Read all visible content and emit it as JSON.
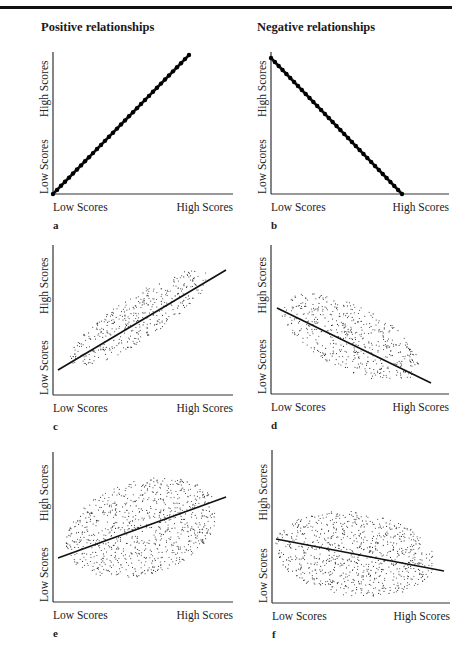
{
  "header": {
    "positive_title": "Positive relationships",
    "negative_title": "Negative relationships"
  },
  "chart_data": [
    {
      "id": "a",
      "type": "line",
      "title": "Positive relationships",
      "letter": "a",
      "xlabel_low": "Low Scores",
      "xlabel_high": "High Scores",
      "ylabel_low": "Low Scores",
      "ylabel_high": "High Scores",
      "relationship": "perfect positive",
      "r": 1.0,
      "line": {
        "x": [
          0,
          0.75
        ],
        "y": [
          0,
          0.98
        ],
        "style": "dotted-heavy"
      },
      "scatter": null,
      "frame": {
        "x0": 53,
        "y0": 194,
        "x1": 233,
        "ytop": 52,
        "lx0": 53,
        "ly0": 194,
        "lx1": 189,
        "ly1": 55
      }
    },
    {
      "id": "b",
      "type": "line",
      "title": "Negative relationships",
      "letter": "b",
      "xlabel_low": "Low Scores",
      "xlabel_high": "High Scores",
      "ylabel_low": "Low Scores",
      "ylabel_high": "High Scores",
      "relationship": "perfect negative",
      "r": -1.0,
      "line": {
        "x": [
          0,
          0.74
        ],
        "y": [
          0.95,
          0
        ],
        "style": "dotted-heavy"
      },
      "scatter": null,
      "frame": {
        "x0": 271,
        "y0": 194,
        "x1": 449,
        "ytop": 52,
        "lx0": 271,
        "ly0": 58,
        "lx1": 402,
        "ly1": 194
      }
    },
    {
      "id": "c",
      "type": "scatter",
      "letter": "c",
      "xlabel_low": "Low Scores",
      "xlabel_high": "High Scores",
      "ylabel_low": "Low Scores",
      "ylabel_high": "High Scores",
      "relationship": "strong positive",
      "line": {
        "style": "solid"
      },
      "scatter": {
        "cx": 139,
        "cy": 318,
        "rx": 82,
        "ry": 22,
        "angle": -33,
        "count": 420
      },
      "frame": {
        "x0": 53,
        "y0": 395,
        "x1": 233,
        "ytop": 245,
        "lx0": 58,
        "ly0": 370,
        "lx1": 226,
        "ly1": 270
      }
    },
    {
      "id": "d",
      "type": "scatter",
      "letter": "d",
      "xlabel_low": "Low Scores",
      "xlabel_high": "High Scores",
      "ylabel_low": "Low Scores",
      "ylabel_high": "High Scores",
      "relationship": "moderate negative",
      "line": {
        "style": "solid"
      },
      "scatter": {
        "cx": 350,
        "cy": 337,
        "rx": 76,
        "ry": 32,
        "angle": 26,
        "count": 520
      },
      "frame": {
        "x0": 271,
        "y0": 394,
        "x1": 449,
        "ytop": 245,
        "lx0": 277,
        "ly0": 308,
        "lx1": 431,
        "ly1": 383
      }
    },
    {
      "id": "e",
      "type": "scatter",
      "letter": "e",
      "xlabel_low": "Low Scores",
      "xlabel_high": "High Scores",
      "ylabel_low": "Low Scores",
      "ylabel_high": "High Scores",
      "relationship": "weak positive",
      "line": {
        "style": "solid"
      },
      "scatter": {
        "cx": 142,
        "cy": 528,
        "rx": 78,
        "ry": 47,
        "angle": -17,
        "count": 880
      },
      "frame": {
        "x0": 53,
        "y0": 602,
        "x1": 233,
        "ytop": 452,
        "lx0": 58,
        "ly0": 558,
        "lx1": 226,
        "ly1": 497
      }
    },
    {
      "id": "f",
      "type": "scatter",
      "letter": "f",
      "xlabel_low": "Low Scores",
      "xlabel_high": "High Scores",
      "ylabel_low": "Low Scores",
      "ylabel_high": "High Scores",
      "relationship": "weak negative",
      "line": {
        "style": "solid"
      },
      "scatter": {
        "cx": 355,
        "cy": 554,
        "rx": 80,
        "ry": 42,
        "angle": 7,
        "count": 860
      },
      "frame": {
        "x0": 272,
        "y0": 603,
        "x1": 450,
        "ytop": 450,
        "lx0": 276,
        "ly0": 539,
        "lx1": 444,
        "ly1": 571
      }
    }
  ]
}
